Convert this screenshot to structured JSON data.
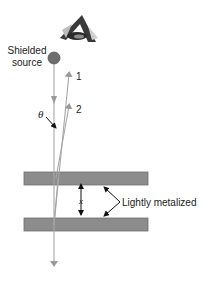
{
  "diagram": {
    "type": "physics-interference-setup",
    "labels": {
      "source_line1": "Shielded",
      "source_line2": "source",
      "ray1": "1",
      "ray2": "2",
      "angle": "θ",
      "gap": "x",
      "plates": "Lightly metalized"
    },
    "icons": [
      "eye-icon"
    ],
    "colors": {
      "plate_fill": "#8c8c8c",
      "plate_stroke": "#6f6f6f",
      "ray": "#a6a6a6",
      "source_fill": "#6e6e6e",
      "text": "#222222",
      "callout": "#222222"
    },
    "elements": {
      "source": {
        "cx": 54,
        "cy": 58,
        "r": 6
      },
      "top_plate": {
        "x": 24,
        "y": 172,
        "w": 124,
        "h": 13
      },
      "bottom_plate": {
        "x": 24,
        "y": 218,
        "w": 124,
        "h": 13
      }
    }
  }
}
